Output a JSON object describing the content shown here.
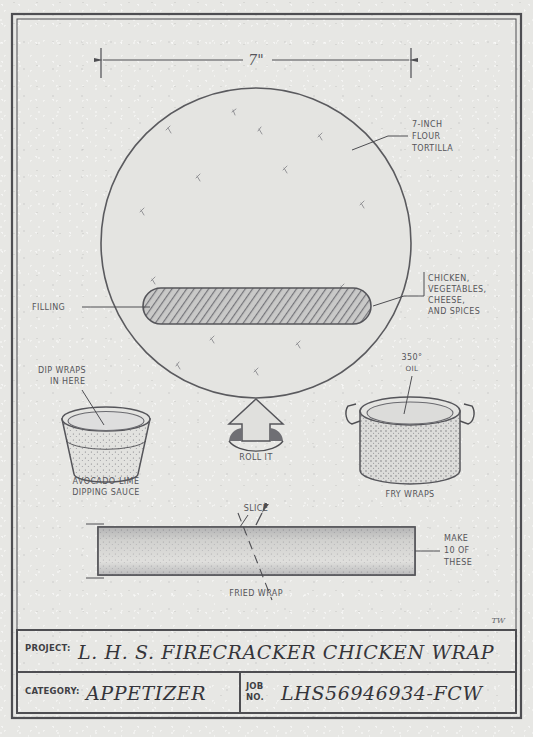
{
  "sheet": {
    "dimension": {
      "label": "7\""
    },
    "initials": "TW"
  },
  "callouts": {
    "tortilla": [
      "7-INCH",
      "FLOUR",
      "TORTILLA"
    ],
    "filling_parts": [
      "CHICKEN,",
      "VEGETABLES,",
      "CHEESE,",
      "AND SPICES"
    ],
    "filling": "FILLING",
    "dip": [
      "DIP WRAPS",
      "IN HERE"
    ],
    "sauce": [
      "AVOCADO-LIME",
      "DIPPING SAUCE"
    ],
    "oil": [
      "350°",
      "OIL"
    ],
    "fry": "FRY WRAPS",
    "roll": "ROLL IT",
    "slice": "SLICE",
    "make": [
      "MAKE",
      "10 OF",
      "THESE"
    ],
    "fried_wrap": "FRIED WRAP"
  },
  "title_block": {
    "project_label": "PROJECT:",
    "project_value": "L. H. S. FIRECRACKER CHICKEN WRAP",
    "category_label": "CATEGORY:",
    "category_value": "APPETIZER",
    "job_label_1": "JOB",
    "job_label_2": "NO.",
    "job_value": "LHS56946934-FCW"
  },
  "colors": {
    "ink": "#4e4e52",
    "paper": "#e7e7e4",
    "fill_hatch": "#8e8e92"
  }
}
